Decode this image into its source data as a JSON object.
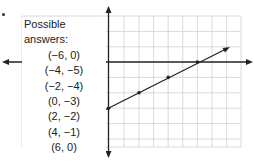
{
  "panel": {
    "title": "Possible answers:",
    "answers": [
      "(−6, 0)",
      "(−4, −5)",
      "(−2, −4)",
      "(0, −3)",
      "(2, −2)",
      "(4, −1)",
      "(6, 0)"
    ]
  },
  "graph": {
    "grid_color": "#cfcfcf",
    "axis_color": "#222222",
    "line_color": "#222222",
    "line_points": [
      [
        0,
        -3
      ],
      [
        2,
        -2
      ],
      [
        4,
        -1
      ],
      [
        6,
        0
      ]
    ],
    "line_equation_slope": 0.5,
    "line_equation_intercept": -3
  }
}
